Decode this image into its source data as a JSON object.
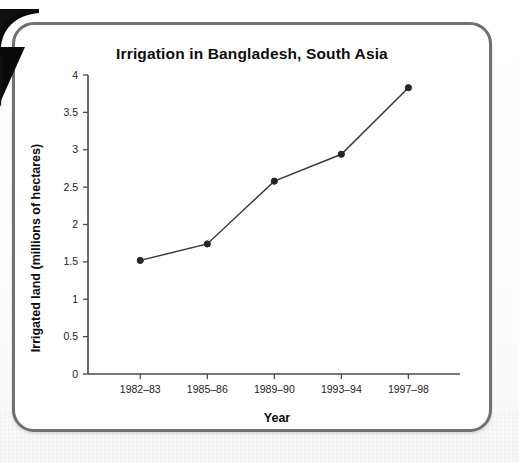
{
  "figure": {
    "arrow_icon": "arrow-pointer-icon",
    "border_color": "#6e7072",
    "background_color": "#ffffff"
  },
  "chart_data": {
    "type": "line",
    "title": "Irrigation in Bangladesh, South Asia",
    "xlabel": "Year",
    "ylabel": "Irrigated land (millions of hectares)",
    "categories": [
      "1982–83",
      "1985–86",
      "1989–90",
      "1993–94",
      "1997–98"
    ],
    "values": [
      1.52,
      1.74,
      2.58,
      2.94,
      3.83
    ],
    "series": [
      {
        "name": "Irrigated land",
        "values": [
          1.52,
          1.74,
          2.58,
          2.94,
          3.83
        ],
        "color": "#3b3b3b",
        "marker": "circle"
      }
    ],
    "ylim": [
      0,
      4
    ],
    "yticks": [
      0,
      0.5,
      1,
      1.5,
      2,
      2.5,
      3,
      3.5,
      4
    ],
    "ytick_labels": [
      "0",
      "0.5",
      "1",
      "1.5",
      "2",
      "2.5",
      "3",
      "3.5",
      "4"
    ],
    "grid": false,
    "legend": false,
    "legend_position": "none"
  }
}
